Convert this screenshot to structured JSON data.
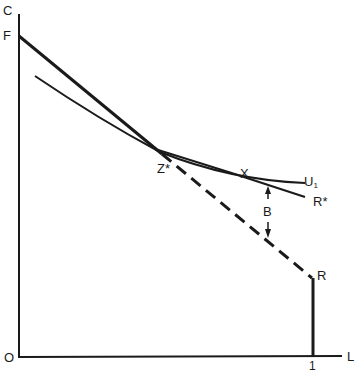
{
  "diagram": {
    "axes": {
      "y_label": "C",
      "x_label": "L",
      "origin_label": "O",
      "x_tick_label": "1"
    },
    "points": {
      "F": "F",
      "Z_star": "Z*",
      "X": "X",
      "R": "R",
      "R_star": "R*",
      "B": "B"
    },
    "curves": {
      "U1_main": "U",
      "U1_sub": "1"
    },
    "colors": {
      "ink": "#1a1a1a",
      "background": "#ffffff"
    }
  }
}
